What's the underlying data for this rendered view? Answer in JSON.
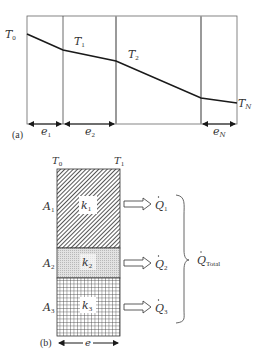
{
  "figure_a": {
    "tag": "(a)",
    "temperatures": {
      "t0": "T",
      "t0_sub": "0",
      "t1": "T",
      "t1_sub": "1",
      "t2": "T",
      "t2_sub": "2",
      "tn": "T",
      "tn_sub": "N"
    },
    "thicknesses": {
      "e1": "e",
      "e1_sub": "1",
      "e2": "e",
      "e2_sub": "2",
      "en": "e",
      "en_sub": "N"
    }
  },
  "figure_b": {
    "tag": "(b)",
    "face_temps": {
      "left": "T",
      "left_sub": "0",
      "right": "T",
      "right_sub": "1"
    },
    "layers": [
      {
        "area": "A",
        "area_sub": "1",
        "conductivity": "k",
        "k_sub": "1",
        "flow": "Q",
        "flow_sub": "1",
        "pattern": "diagonal-hatch"
      },
      {
        "area": "A",
        "area_sub": "2",
        "conductivity": "k",
        "k_sub": "2",
        "flow": "Q",
        "flow_sub": "2",
        "pattern": "dots"
      },
      {
        "area": "A",
        "area_sub": "3",
        "conductivity": "k",
        "k_sub": "3",
        "flow": "Q",
        "flow_sub": "3",
        "pattern": "grid"
      }
    ],
    "total": {
      "label": "Q",
      "sub": "Total"
    },
    "thickness": "e"
  },
  "colors": {
    "line": "#1a1a1a",
    "frame": "#555555",
    "thick_divider": "#9a9a9a",
    "dots_fill": "#d9d9d9"
  }
}
